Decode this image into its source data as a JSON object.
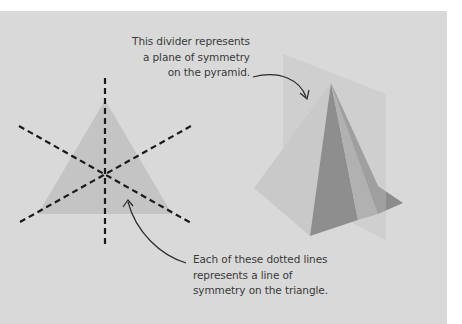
{
  "figure": {
    "background_color": "#d9d9d9",
    "triangle_fill": "#c4c4c4",
    "line_color": "#1a1a1a",
    "pyramid_colors": {
      "left_face": "#c9c9c9",
      "front_face": "#8e8e8e",
      "right_face": "#a5a5a5",
      "right_back": "#8a8a8a",
      "plane": "#c8c8c8"
    }
  },
  "annotations": {
    "pyramid_plane": {
      "lines": [
        "This divider represents",
        "a plane of symmetry",
        "on the pyramid."
      ]
    },
    "triangle_lines": {
      "lines": [
        "Each of these dotted lines",
        "represents a line of",
        "symmetry on the triangle."
      ]
    }
  },
  "labels": {
    "left_shape": "triangle",
    "right_shape": "pyramid",
    "triangle_symmetry_line_count": 3
  }
}
